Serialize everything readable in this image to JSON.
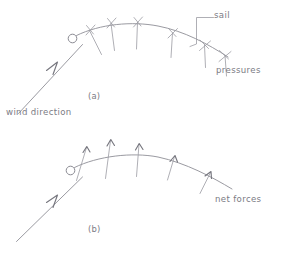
{
  "figure": {
    "background_color": "#ffffff",
    "ink_color": "#8e8e96",
    "style": "hand-drawn sketch"
  },
  "labels": {
    "sail": "sail",
    "pressures": "pressures",
    "wind_direction": "wind direction",
    "net_forces": "net forces",
    "panel_a": "(a)",
    "panel_b": "(b)"
  },
  "panels": [
    {
      "id": "a",
      "caption": "(a)",
      "description": "Sail curve with pressure tick marks crossing the sail surface",
      "curve": {
        "start": [
          72,
          36
        ],
        "control_1": [
          120,
          16
        ],
        "control_2": [
          180,
          34
        ],
        "end": [
          226,
          58
        ]
      },
      "mast": {
        "cx": 72,
        "cy": 38,
        "r": 4.2
      },
      "marker_type": "cross-tick",
      "marker_count": 6,
      "markers": [
        {
          "x": 92,
          "y": 30,
          "angle": -22,
          "length": 18
        },
        {
          "x": 112,
          "y": 25,
          "angle": -12,
          "length": 20
        },
        {
          "x": 138,
          "y": 25,
          "angle": -3,
          "length": 20
        },
        {
          "x": 175,
          "y": 37,
          "angle": 12,
          "length": 18
        },
        {
          "x": 206,
          "y": 50,
          "angle": 22,
          "length": 17
        }
      ],
      "wind_arrow": {
        "tail": [
          20,
          112
        ],
        "tip": [
          82,
          45
        ],
        "label": "wind direction"
      },
      "leader": {
        "label": "sail",
        "points": [
          [
            212,
            17
          ],
          [
            196,
            17
          ],
          [
            196,
            44
          ],
          [
            190,
            46
          ]
        ]
      }
    },
    {
      "id": "b",
      "caption": "(b)",
      "description": "Sail curve with net force arrows pointing outward from the sail",
      "curve": {
        "start": [
          72,
          165
        ],
        "control_1": [
          120,
          146
        ],
        "control_2": [
          180,
          163
        ],
        "end": [
          228,
          188
        ]
      },
      "mast": {
        "cx": 70,
        "cy": 168,
        "r": 4.2
      },
      "marker_type": "arrow",
      "marker_count": 5,
      "markers": [
        {
          "x": 88,
          "y": 160,
          "angle": -20,
          "length": 22
        },
        {
          "x": 110,
          "y": 154,
          "angle": -10,
          "length": 26
        },
        {
          "x": 138,
          "y": 154,
          "angle": -2,
          "length": 24
        },
        {
          "x": 176,
          "y": 167,
          "angle": 14,
          "length": 18
        },
        {
          "x": 206,
          "y": 180,
          "angle": 24,
          "length": 16
        }
      ],
      "wind_arrow": {
        "tail": [
          18,
          240
        ],
        "tip": [
          82,
          178
        ]
      },
      "force_label": "net forces"
    }
  ]
}
